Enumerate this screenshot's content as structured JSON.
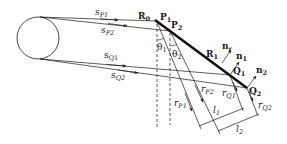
{
  "figure": {
    "labels": {
      "R0": {
        "main": "R",
        "sub": "0"
      },
      "R1": {
        "main": "R",
        "sub": "1"
      },
      "P1": {
        "main": "P",
        "sub": "1"
      },
      "P2": {
        "main": "P",
        "sub": "2"
      },
      "Q1": {
        "main": "Q",
        "sub": "1"
      },
      "Q2": {
        "main": "Q",
        "sub": "2"
      },
      "n1": {
        "main": "n",
        "sub": "1"
      },
      "n2": {
        "main": "n",
        "sub": "2"
      },
      "nr": {
        "main": "n",
        "sub": "r"
      },
      "sP1": {
        "main": "s",
        "sub": "P1"
      },
      "sP2": {
        "main": "s",
        "sub": "P2"
      },
      "sQ1": {
        "main": "s",
        "sub": "Q1"
      },
      "sQ2": {
        "main": "s",
        "sub": "Q2"
      },
      "rP1": {
        "main": "r",
        "sub": "P1"
      },
      "rP2": {
        "main": "r",
        "sub": "P2"
      },
      "rQ1": {
        "main": "r",
        "sub": "Q1"
      },
      "rQ2": {
        "main": "r",
        "sub": "Q2"
      },
      "theta1": {
        "main": "θ",
        "sub": "1"
      },
      "theta2": {
        "main": "θ",
        "sub": "2"
      },
      "l1": {
        "main": "l",
        "sub": "1"
      },
      "l2": {
        "main": "l",
        "sub": "2"
      }
    },
    "colors": {
      "stroke": "#1a1a1a",
      "background": "#ffffff"
    }
  }
}
